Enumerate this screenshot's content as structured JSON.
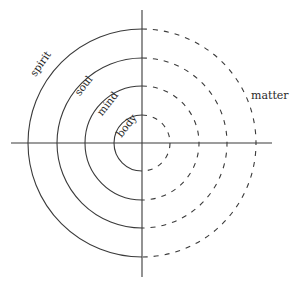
{
  "diagram": {
    "type": "concentric-half-circles",
    "center": [
      142,
      143
    ],
    "axes": {
      "horizontal": {
        "x1": 11,
        "x2": 272,
        "y": 143
      },
      "vertical": {
        "x": 142,
        "y1": 10,
        "y2": 277
      }
    },
    "rings": [
      {
        "label": "body",
        "radius": 28,
        "label_pos": [
          127,
          126
        ],
        "label_angle": -52
      },
      {
        "label": "mind",
        "radius": 57,
        "label_pos": [
          108,
          104
        ],
        "label_angle": -52
      },
      {
        "label": "soul",
        "radius": 85,
        "label_pos": [
          84,
          86
        ],
        "label_angle": -52
      },
      {
        "label": "spirit",
        "radius": 114,
        "label_pos": [
          41,
          64
        ],
        "label_angle": -55
      }
    ],
    "left_half_style": "solid",
    "right_half_style": "dashed",
    "side_label": {
      "text": "matter",
      "pos": [
        251,
        96
      ]
    },
    "colors": {
      "line": "#3a3a3a",
      "text": "#2a2a2a",
      "background": "#ffffff"
    }
  }
}
